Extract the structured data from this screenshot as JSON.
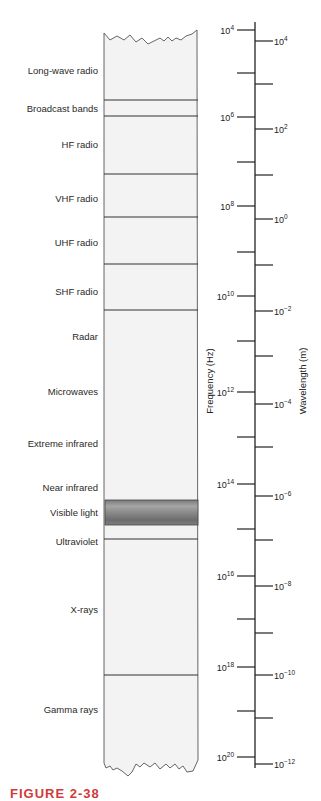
{
  "figure": {
    "caption": "FIGURE 2-38",
    "column_fill": "#f3f3f3",
    "line_color": "#333333",
    "caption_color": "#d23a3a"
  },
  "chart_data": {
    "type": "diagram",
    "bands": [
      {
        "label": "Long-wave radio",
        "y": 70
      },
      {
        "label": "Broadcast bands",
        "y": 108
      },
      {
        "label": "HF radio",
        "y": 144
      },
      {
        "label": "VHF radio",
        "y": 198
      },
      {
        "label": "UHF radio",
        "y": 242
      },
      {
        "label": "SHF radio",
        "y": 291
      },
      {
        "label": "Radar",
        "y": 336
      },
      {
        "label": "Microwaves",
        "y": 391
      },
      {
        "label": "Extreme infrared",
        "y": 443
      },
      {
        "label": "Near infrared",
        "y": 487
      },
      {
        "label": "Visible light",
        "y": 512
      },
      {
        "label": "Ultraviolet",
        "y": 541
      },
      {
        "label": "X-rays",
        "y": 609
      },
      {
        "label": "Gamma rays",
        "y": 709
      }
    ],
    "dividers_y": [
      100,
      116,
      174,
      217,
      264,
      310,
      539,
      675
    ],
    "visible_band": {
      "top": 500,
      "bottom": 525
    },
    "frequency_axis": {
      "title": "Frequency (Hz)",
      "ticks": [
        {
          "y": 30,
          "base": "10",
          "exp": "4"
        },
        {
          "y": 73
        },
        {
          "y": 117,
          "base": "10",
          "exp": "6"
        },
        {
          "y": 162
        },
        {
          "y": 206,
          "base": "10",
          "exp": "8"
        },
        {
          "y": 252
        },
        {
          "y": 296,
          "base": "10",
          "exp": "10"
        },
        {
          "y": 341
        },
        {
          "y": 392,
          "base": "10",
          "exp": "12"
        },
        {
          "y": 437
        },
        {
          "y": 484,
          "base": "10",
          "exp": "14"
        },
        {
          "y": 529
        },
        {
          "y": 576,
          "base": "10",
          "exp": "16"
        },
        {
          "y": 619
        },
        {
          "y": 667,
          "base": "10",
          "exp": "18"
        },
        {
          "y": 711
        },
        {
          "y": 757,
          "base": "10",
          "exp": "20"
        }
      ]
    },
    "wavelength_axis": {
      "title": "Wavelength (m)",
      "ticks": [
        {
          "y": 41,
          "base": "10",
          "exp": "4"
        },
        {
          "y": 84
        },
        {
          "y": 129,
          "base": "10",
          "exp": "2"
        },
        {
          "y": 175
        },
        {
          "y": 219,
          "base": "10",
          "exp": "0"
        },
        {
          "y": 265
        },
        {
          "y": 311,
          "base": "10",
          "exp": "−2"
        },
        {
          "y": 356
        },
        {
          "y": 404,
          "base": "10",
          "exp": "−4"
        },
        {
          "y": 447
        },
        {
          "y": 496,
          "base": "10",
          "exp": "−6"
        },
        {
          "y": 540
        },
        {
          "y": 586,
          "base": "10",
          "exp": "−8"
        },
        {
          "y": 633
        },
        {
          "y": 675,
          "base": "10",
          "exp": "−10"
        },
        {
          "y": 718
        },
        {
          "y": 764,
          "base": "10",
          "exp": "−12"
        }
      ]
    }
  }
}
